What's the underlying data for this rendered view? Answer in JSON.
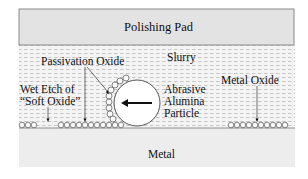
{
  "diagram": {
    "pad_label": "Polishing Pad",
    "slurry_label": "Slurry",
    "passivation_label": "Passivation Oxide",
    "wet_etch_label_line1": "Wet Etch of",
    "wet_etch_label_line2": "“Soft Oxide”",
    "particle_label_line1": "Abrasive",
    "particle_label_line2": "Alumina",
    "particle_label_line3": "Particle",
    "metal_oxide_label": "Metal Oxide",
    "metal_label": "Metal"
  },
  "colors": {
    "pad_fill": "#e4e4e4",
    "slurry_fill": "#f3f3f3",
    "slurry_dash": "#c8c8c8",
    "metal_fill": "#eeeeee",
    "stroke": "#555555"
  }
}
